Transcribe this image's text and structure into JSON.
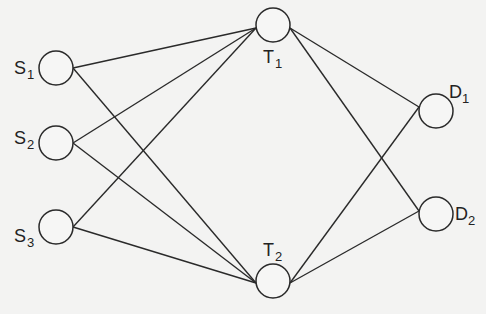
{
  "diagram": {
    "type": "network-graph",
    "colors": {
      "background": "#f3f3f2",
      "stroke": "#2a2a2a",
      "node_fill": "#f6f6f5",
      "text": "#222222"
    },
    "nodes": [
      {
        "id": "S1",
        "base": "S",
        "sub": "1",
        "cx": 56,
        "cy": 68,
        "r": 17,
        "label_x": 14,
        "label_y": 74,
        "sub_x": 27,
        "sub_y": 79
      },
      {
        "id": "S2",
        "base": "S",
        "sub": "2",
        "cx": 56,
        "cy": 143,
        "r": 17,
        "label_x": 14,
        "label_y": 144,
        "sub_x": 27,
        "sub_y": 149
      },
      {
        "id": "S3",
        "base": "S",
        "sub": "3",
        "cx": 56,
        "cy": 227,
        "r": 17,
        "label_x": 14,
        "label_y": 242,
        "sub_x": 27,
        "sub_y": 247
      },
      {
        "id": "T1",
        "base": "T",
        "sub": "1",
        "cx": 273,
        "cy": 25,
        "r": 17,
        "label_x": 263,
        "label_y": 63,
        "sub_x": 275,
        "sub_y": 68
      },
      {
        "id": "T2",
        "base": "T",
        "sub": "2",
        "cx": 273,
        "cy": 281,
        "r": 17,
        "label_x": 263,
        "label_y": 256,
        "sub_x": 275,
        "sub_y": 261
      },
      {
        "id": "D1",
        "base": "D",
        "sub": "1",
        "cx": 436,
        "cy": 111,
        "r": 17,
        "label_x": 449,
        "label_y": 98,
        "sub_x": 462,
        "sub_y": 103
      },
      {
        "id": "D2",
        "base": "D",
        "sub": "2",
        "cx": 436,
        "cy": 214,
        "r": 17,
        "label_x": 455,
        "label_y": 220,
        "sub_x": 468,
        "sub_y": 225
      }
    ],
    "edges": [
      {
        "from": "S1",
        "to": "T1",
        "x1": 73,
        "y1": 68,
        "x2": 256,
        "y2": 28
      },
      {
        "from": "S1",
        "to": "T2",
        "x1": 73,
        "y1": 68,
        "x2": 256,
        "y2": 283
      },
      {
        "from": "S2",
        "to": "T1",
        "x1": 73,
        "y1": 143,
        "x2": 256,
        "y2": 28
      },
      {
        "from": "S2",
        "to": "T2",
        "x1": 73,
        "y1": 143,
        "x2": 256,
        "y2": 283
      },
      {
        "from": "S3",
        "to": "T1",
        "x1": 73,
        "y1": 227,
        "x2": 256,
        "y2": 28
      },
      {
        "from": "S3",
        "to": "T2",
        "x1": 73,
        "y1": 227,
        "x2": 256,
        "y2": 283
      },
      {
        "from": "T1",
        "to": "D1",
        "x1": 290,
        "y1": 28,
        "x2": 419,
        "y2": 107
      },
      {
        "from": "T1",
        "to": "D2",
        "x1": 290,
        "y1": 28,
        "x2": 419,
        "y2": 211
      },
      {
        "from": "T2",
        "to": "D1",
        "x1": 290,
        "y1": 283,
        "x2": 419,
        "y2": 107
      },
      {
        "from": "T2",
        "to": "D2",
        "x1": 290,
        "y1": 283,
        "x2": 419,
        "y2": 211
      }
    ]
  }
}
